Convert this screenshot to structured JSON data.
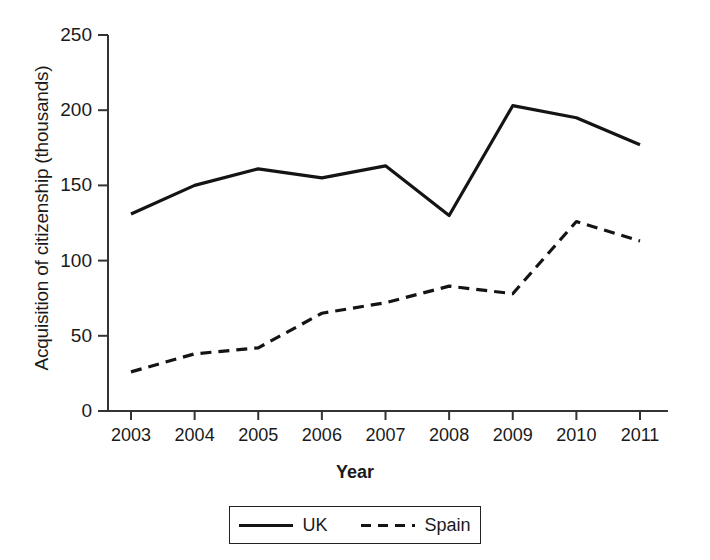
{
  "chart_data": {
    "type": "line",
    "title": "",
    "xlabel": "Year",
    "ylabel": "Acquisition of citizenship (thousands)",
    "categories": [
      "2003",
      "2004",
      "2005",
      "2006",
      "2007",
      "2008",
      "2009",
      "2010",
      "2011"
    ],
    "x": [
      2003,
      2004,
      2005,
      2006,
      2007,
      2008,
      2009,
      2010,
      2011
    ],
    "series": [
      {
        "name": "UK",
        "style": "solid",
        "color": "#141414",
        "values": [
          131,
          150,
          161,
          155,
          163,
          130,
          203,
          195,
          177
        ]
      },
      {
        "name": "Spain",
        "style": "dashed",
        "color": "#141414",
        "values": [
          26,
          38,
          42,
          65,
          72,
          83,
          78,
          126,
          113
        ]
      }
    ],
    "ylim": [
      0,
      250
    ],
    "yticks": [
      0,
      50,
      100,
      150,
      200,
      250
    ],
    "ytick_labels": [
      "0",
      "50",
      "100",
      "150",
      "200",
      "250"
    ],
    "grid": false,
    "legend_position": "bottom-center",
    "legend_entries": [
      {
        "label": "UK",
        "style": "solid"
      },
      {
        "label": "Spain",
        "style": "dashed"
      }
    ]
  },
  "axes": {
    "y_title": "Acquisition of citizenship (thousands)",
    "x_title": "Year"
  }
}
